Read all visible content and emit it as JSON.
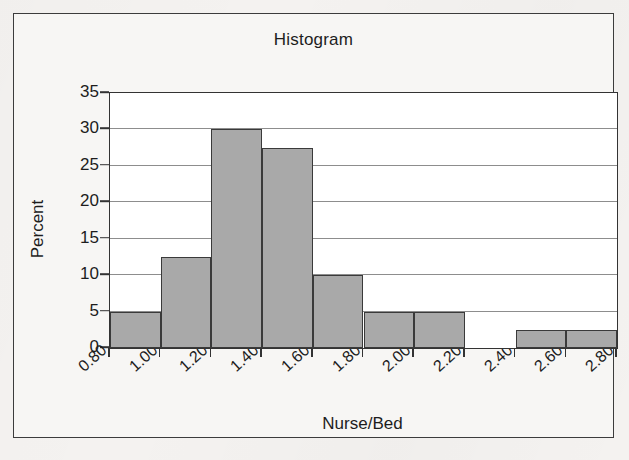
{
  "figure": {
    "background_color": "#f4f2f0",
    "frame_border_color": "#3c3c3c",
    "plot_background": "#ffffff"
  },
  "chart_data": {
    "type": "bar",
    "title": "Histogram",
    "xlabel": "Nurse/Bed",
    "ylabel": "Percent",
    "grid": true,
    "legend": null,
    "bar_fill_color": "#a9a9a9",
    "bar_edge_color": "#3a3a3a",
    "xlim": [
      0.8,
      2.8
    ],
    "ylim": [
      0,
      35
    ],
    "bin_width": 0.2,
    "xtick_labels": [
      "0.80",
      "1.00",
      "1.20",
      "1.40",
      "1.60",
      "1.80",
      "2.00",
      "2.20",
      "2.40",
      "2.60",
      "2.80"
    ],
    "xtick_values": [
      0.8,
      1.0,
      1.2,
      1.4,
      1.6,
      1.8,
      2.0,
      2.2,
      2.4,
      2.6,
      2.8
    ],
    "ytick_labels": [
      "0",
      "5",
      "10",
      "15",
      "20",
      "25",
      "30",
      "35"
    ],
    "ytick_values": [
      0,
      5,
      10,
      15,
      20,
      25,
      30,
      35
    ],
    "bins": [
      {
        "left": 0.8,
        "right": 1.0,
        "label": "0.80-1.00",
        "value": 5.0
      },
      {
        "left": 1.0,
        "right": 1.2,
        "label": "1.00-1.20",
        "value": 12.5
      },
      {
        "left": 1.2,
        "right": 1.4,
        "label": "1.20-1.40",
        "value": 30.0
      },
      {
        "left": 1.4,
        "right": 1.6,
        "label": "1.40-1.60",
        "value": 27.5
      },
      {
        "left": 1.6,
        "right": 1.8,
        "label": "1.60-1.80",
        "value": 10.0
      },
      {
        "left": 1.8,
        "right": 2.0,
        "label": "1.80-2.00",
        "value": 5.0
      },
      {
        "left": 2.0,
        "right": 2.2,
        "label": "2.00-2.20",
        "value": 5.0
      },
      {
        "left": 2.2,
        "right": 2.4,
        "label": "2.20-2.40",
        "value": 0.0
      },
      {
        "left": 2.4,
        "right": 2.6,
        "label": "2.40-2.60",
        "value": 2.5
      },
      {
        "left": 2.6,
        "right": 2.8,
        "label": "2.60-2.80",
        "value": 2.5
      }
    ],
    "categories": [
      "0.80-1.00",
      "1.00-1.20",
      "1.20-1.40",
      "1.40-1.60",
      "1.60-1.80",
      "1.80-2.00",
      "2.00-2.20",
      "2.20-2.40",
      "2.40-2.60",
      "2.60-2.80"
    ],
    "values": [
      5.0,
      12.5,
      30.0,
      27.5,
      10.0,
      5.0,
      5.0,
      0.0,
      2.5,
      2.5
    ]
  }
}
